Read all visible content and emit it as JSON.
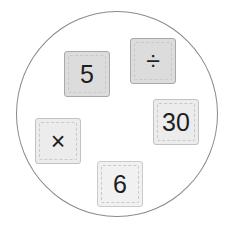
{
  "puzzle": {
    "tiles": [
      {
        "id": "five",
        "label": "5",
        "type": "number"
      },
      {
        "id": "divide",
        "label": "÷",
        "type": "operator"
      },
      {
        "id": "thirty",
        "label": "30",
        "type": "number"
      },
      {
        "id": "multiply",
        "label": "×",
        "type": "operator"
      },
      {
        "id": "six",
        "label": "6",
        "type": "number"
      }
    ]
  }
}
